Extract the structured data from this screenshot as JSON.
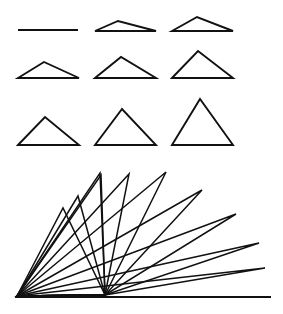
{
  "figure": {
    "background_color": "#ffffff",
    "stroke_color": "#111111",
    "width": 283,
    "height": 314
  },
  "grid": {
    "name": "triangle-grid",
    "rows": 3,
    "columns": 3,
    "shapes": [
      {
        "id": "triangle-1",
        "row": 1,
        "col": 1,
        "label": "degenerate-flat-line",
        "base_left": [
          18,
          30
        ],
        "base_right": [
          78,
          30
        ],
        "apex": [
          48,
          30
        ],
        "apex_height": 0,
        "closed": false
      },
      {
        "id": "triangle-2",
        "row": 1,
        "col": 2,
        "label": "very-shallow-triangle",
        "base_left": [
          95,
          31
        ],
        "base_right": [
          156,
          31
        ],
        "apex": [
          118,
          21
        ],
        "apex_height": 10,
        "closed": true
      },
      {
        "id": "triangle-3",
        "row": 1,
        "col": 3,
        "label": "shallow-triangle",
        "base_left": [
          172,
          31
        ],
        "base_right": [
          233,
          31
        ],
        "apex": [
          197,
          17
        ],
        "apex_height": 14,
        "closed": true
      },
      {
        "id": "triangle-4",
        "row": 2,
        "col": 1,
        "label": "low-triangle",
        "base_left": [
          18,
          78
        ],
        "base_right": [
          79,
          78
        ],
        "apex": [
          44,
          62
        ],
        "apex_height": 16,
        "closed": true
      },
      {
        "id": "triangle-5",
        "row": 2,
        "col": 2,
        "label": "medium-low-triangle",
        "base_left": [
          95,
          78
        ],
        "base_right": [
          156,
          78
        ],
        "apex": [
          121,
          57
        ],
        "apex_height": 21,
        "closed": true
      },
      {
        "id": "triangle-6",
        "row": 2,
        "col": 3,
        "label": "medium-triangle",
        "base_left": [
          172,
          78
        ],
        "base_right": [
          233,
          78
        ],
        "apex": [
          198,
          51
        ],
        "apex_height": 27,
        "closed": true
      },
      {
        "id": "triangle-7",
        "row": 3,
        "col": 1,
        "label": "medium-tall-triangle",
        "base_left": [
          18,
          145
        ],
        "base_right": [
          79,
          145
        ],
        "apex": [
          45,
          117
        ],
        "apex_height": 28,
        "closed": true
      },
      {
        "id": "triangle-8",
        "row": 3,
        "col": 2,
        "label": "tall-triangle",
        "base_left": [
          95,
          145
        ],
        "base_right": [
          156,
          145
        ],
        "apex": [
          122,
          109
        ],
        "apex_height": 36,
        "closed": true
      },
      {
        "id": "triangle-9",
        "row": 3,
        "col": 3,
        "label": "tallest-triangle",
        "base_left": [
          172,
          145
        ],
        "base_right": [
          233,
          145
        ],
        "apex": [
          200,
          99
        ],
        "apex_height": 46,
        "closed": true
      }
    ]
  },
  "fan": {
    "name": "triangle-fan-overlay",
    "pivot_left": [
      17,
      296
    ],
    "pivot_mid": [
      105,
      295
    ],
    "baseline_left": [
      15,
      297
    ],
    "baseline_right": [
      271,
      297
    ],
    "rays": [
      {
        "id": "fan-ray-1",
        "apex": [
          63,
          208
        ],
        "note": "steepest-left"
      },
      {
        "id": "fan-ray-2",
        "apex": [
          78,
          196
        ],
        "note": ""
      },
      {
        "id": "fan-ray-3",
        "apex": [
          100,
          173
        ],
        "note": ""
      },
      {
        "id": "fan-ray-4",
        "apex": [
          101,
          175
        ],
        "note": ""
      },
      {
        "id": "fan-ray-5",
        "apex": [
          129,
          174
        ],
        "note": ""
      },
      {
        "id": "fan-ray-6",
        "apex": [
          166,
          172
        ],
        "note": ""
      },
      {
        "id": "fan-ray-7",
        "apex": [
          202,
          190
        ],
        "note": ""
      },
      {
        "id": "fan-ray-8",
        "apex": [
          236,
          214
        ],
        "note": ""
      },
      {
        "id": "fan-ray-9",
        "apex": [
          259,
          243
        ],
        "note": ""
      },
      {
        "id": "fan-ray-10",
        "apex": [
          265,
          268
        ],
        "note": "shallowest-right"
      }
    ]
  }
}
